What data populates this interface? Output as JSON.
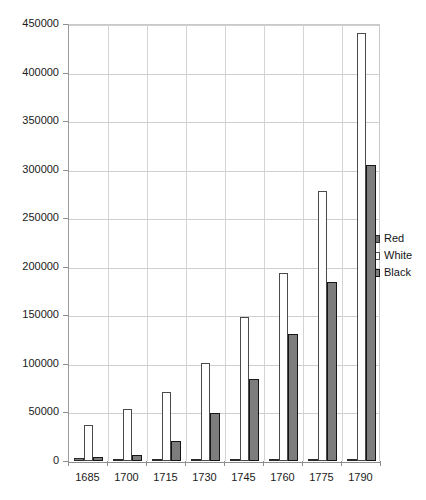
{
  "chart_data": {
    "type": "bar",
    "title": "",
    "subtitle": "",
    "xlabel": "",
    "ylabel": "",
    "categories": [
      "1685",
      "1700",
      "1715",
      "1730",
      "1745",
      "1760",
      "1775",
      "1790"
    ],
    "series": [
      {
        "name": "Red",
        "values": [
          3000,
          2000,
          2000,
          2000,
          1500,
          1500,
          1500,
          1500
        ]
      },
      {
        "name": "White",
        "values": [
          37000,
          54000,
          71000,
          101000,
          148000,
          194000,
          278000,
          441000
        ]
      },
      {
        "name": "Black",
        "values": [
          4000,
          6000,
          21000,
          49000,
          84000,
          131000,
          184000,
          305000
        ]
      }
    ],
    "ylim": [
      0,
      450000
    ],
    "ytick_values": [
      0,
      50000,
      100000,
      150000,
      200000,
      250000,
      300000,
      350000,
      400000,
      450000
    ],
    "ytick_labels": [
      "0",
      "50000",
      "100000",
      "150000",
      "200000",
      "250000",
      "300000",
      "350000",
      "400000",
      "450000"
    ],
    "grid": true,
    "legend_position": "right",
    "legend": [
      {
        "label": "Red",
        "color": "#808080"
      },
      {
        "label": "White",
        "color": "#ffffff"
      },
      {
        "label": "Black",
        "color": "#7d7d7d"
      }
    ]
  }
}
